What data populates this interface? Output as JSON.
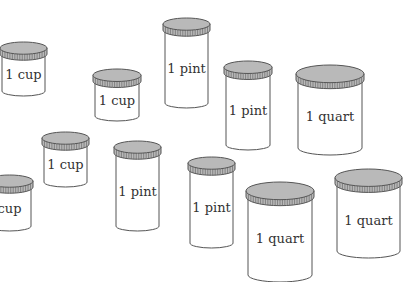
{
  "colors": {
    "lid": "#b9b9b9",
    "outline": "#555555",
    "body": "#ffffff",
    "text": "#333333"
  },
  "jars": [
    {
      "label": "1 cup",
      "size": "cup",
      "x": 0,
      "y": 42,
      "w": 47,
      "h": 54
    },
    {
      "label": "1 cup",
      "size": "cup",
      "x": 93,
      "y": 69,
      "w": 48,
      "h": 52
    },
    {
      "label": "1 pint",
      "size": "pint",
      "x": 163,
      "y": 18,
      "w": 47,
      "h": 90
    },
    {
      "label": "1 pint",
      "size": "pint",
      "x": 224,
      "y": 61,
      "w": 48,
      "h": 89
    },
    {
      "label": "1 quart",
      "size": "quart",
      "x": 296,
      "y": 65,
      "w": 68,
      "h": 90
    },
    {
      "label": "1 cup",
      "size": "cup",
      "x": 42,
      "y": 132,
      "w": 47,
      "h": 55
    },
    {
      "label": "cup",
      "size": "cup",
      "x": -14,
      "y": 175,
      "w": 47,
      "h": 56
    },
    {
      "label": "1 pint",
      "size": "pint",
      "x": 114,
      "y": 141,
      "w": 47,
      "h": 90
    },
    {
      "label": "1 pint",
      "size": "pint",
      "x": 188,
      "y": 157,
      "w": 47,
      "h": 91
    },
    {
      "label": "1 quart",
      "size": "quart",
      "x": 246,
      "y": 182,
      "w": 68,
      "h": 100
    },
    {
      "label": "1 quart",
      "size": "quart",
      "x": 335,
      "y": 169,
      "w": 67,
      "h": 89
    }
  ]
}
